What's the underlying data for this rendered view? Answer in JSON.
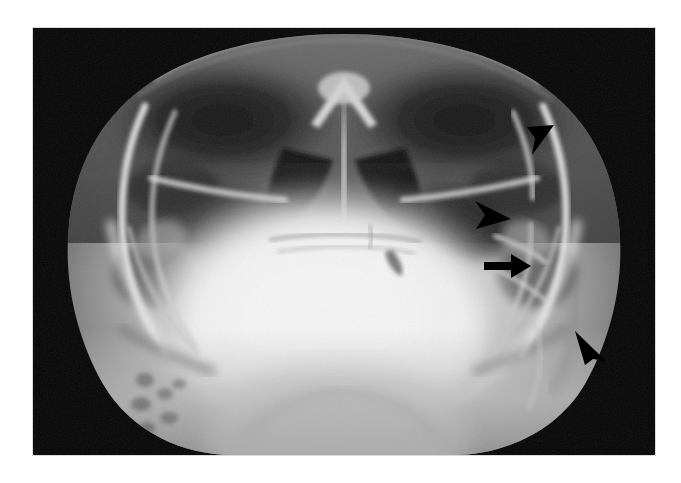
{
  "image": {
    "modality": "radiograph",
    "view": "submentovertex-axial-skull",
    "background_color": "#ffffff",
    "film_color": "#050505",
    "film_rect": {
      "x": 33,
      "y": 28,
      "width": 622,
      "height": 427
    },
    "canvas": {
      "width": 681,
      "height": 483
    }
  },
  "annotations": {
    "marker_color": "#000000",
    "items": [
      {
        "id": "arrowhead-1",
        "glyph": "arrowhead",
        "direction": "down-left",
        "x": 493,
        "y": 96,
        "width": 30,
        "height": 32,
        "label": ""
      },
      {
        "id": "arrowhead-2",
        "glyph": "arrowhead",
        "direction": "right",
        "x": 441,
        "y": 172,
        "width": 38,
        "height": 30,
        "label": ""
      },
      {
        "id": "arrow-1",
        "glyph": "arrow",
        "direction": "right",
        "x": 451,
        "y": 225,
        "width": 48,
        "height": 26,
        "label": ""
      },
      {
        "id": "arrowhead-3",
        "glyph": "arrowhead",
        "direction": "up-left",
        "x": 540,
        "y": 302,
        "width": 34,
        "height": 36,
        "label": ""
      }
    ]
  },
  "anatomy": {
    "regions": [
      "nasal-septum",
      "maxillary-sinus-left",
      "maxillary-sinus-right",
      "zygomatic-arch-left",
      "zygomatic-arch-right",
      "mandibular-ramus-left",
      "mandibular-ramus-right",
      "sphenoid-body",
      "skull-base",
      "foramen-magnum",
      "cranial-vault-outline"
    ]
  }
}
